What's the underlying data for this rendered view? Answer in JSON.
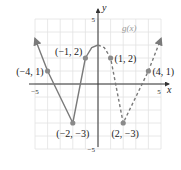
{
  "chart_data": {
    "type": "line",
    "title": "",
    "function_label": "g(x)",
    "xlabel": "x",
    "ylabel": "y",
    "xlim": [
      -5,
      5
    ],
    "ylim": [
      -5,
      5
    ],
    "x_ticks_labeled": [
      -5,
      5
    ],
    "y_ticks_labeled": [
      -5,
      5
    ],
    "tick_labels": {
      "x_neg": "−5",
      "x_pos": "5",
      "y_neg": "−5",
      "y_pos": "5"
    },
    "grid": true,
    "series": [
      {
        "name": "solid-part",
        "style": "solid",
        "arrow_start": true,
        "points": [
          [
            -5,
            3.5
          ],
          [
            -4,
            1
          ],
          [
            -2,
            -3
          ],
          [
            -1,
            2
          ],
          [
            -0.5,
            2.8
          ],
          [
            0,
            3
          ]
        ]
      },
      {
        "name": "dashed-part",
        "style": "dashed",
        "arrow_end": true,
        "points": [
          [
            0,
            3
          ],
          [
            0.5,
            2.8
          ],
          [
            1,
            2
          ],
          [
            2,
            -3
          ],
          [
            4,
            1
          ],
          [
            5,
            3.5
          ]
        ]
      }
    ],
    "labeled_points": [
      {
        "x": -4,
        "y": 1,
        "label": "(−4, 1)"
      },
      {
        "x": -1,
        "y": 2,
        "label": "(−1, 2)"
      },
      {
        "x": 1,
        "y": 2,
        "label": "(1, 2)"
      },
      {
        "x": 4,
        "y": 1,
        "label": "(4, 1)"
      },
      {
        "x": -2,
        "y": -3,
        "label": "(−2, −3)"
      },
      {
        "x": 2,
        "y": -3,
        "label": "(2, −3)"
      }
    ],
    "colors": {
      "curve": "#7a7a7a",
      "point": "#8a8a8a",
      "axis": "#333333",
      "grid": "#e2e2e2",
      "label": "#222222",
      "function_label": "#999999"
    }
  }
}
